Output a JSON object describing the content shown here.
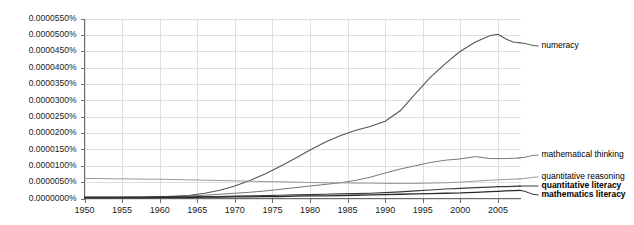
{
  "chart_data": {
    "type": "line",
    "title": "",
    "xlabel": "",
    "ylabel": "",
    "grid": true,
    "legend_position": "inline-right",
    "xlim": [
      1950,
      2008
    ],
    "ylim": [
      0.0,
      5.5e-06
    ],
    "x_tick_labels": [
      "1950",
      "1955",
      "1960",
      "1965",
      "1970",
      "1975",
      "1980",
      "1985",
      "1990",
      "1995",
      "2000",
      "2005"
    ],
    "x_ticks": [
      1950,
      1955,
      1960,
      1965,
      1970,
      1975,
      1980,
      1985,
      1990,
      1995,
      2000,
      2005
    ],
    "y_tick_labels": [
      "0.0000550%",
      "0.0000500%",
      "0.0000450%",
      "0.0000400%",
      "0.0000350%",
      "0.0000300%",
      "0.0000250%",
      "0.0000200%",
      "0.0000150%",
      "0.0000100%",
      "0.0000050%",
      "0.0000000%"
    ],
    "y_ticks": [
      5.5e-06,
      5e-06,
      4.5e-06,
      4e-06,
      3.5e-06,
      3e-06,
      2.5e-06,
      2e-06,
      1.5e-06,
      1e-06,
      5e-07,
      0.0
    ],
    "x": [
      1950,
      1952,
      1954,
      1956,
      1958,
      1960,
      1962,
      1964,
      1966,
      1968,
      1970,
      1972,
      1974,
      1976,
      1978,
      1980,
      1982,
      1984,
      1986,
      1988,
      1990,
      1992,
      1994,
      1996,
      1998,
      2000,
      2002,
      2004,
      2005,
      2006,
      2007,
      2008
    ],
    "series": [
      {
        "name": "numeracy",
        "color": "#555555",
        "width": 1.1,
        "label_color": "#555555",
        "values": [
          2e-08,
          2e-08,
          3e-08,
          3e-08,
          4e-08,
          5e-08,
          7e-08,
          1e-07,
          1.6e-07,
          2.5e-07,
          3.8e-07,
          5.5e-07,
          7.5e-07,
          9.8e-07,
          1.22e-06,
          1.48e-06,
          1.72e-06,
          1.92e-06,
          2.08e-06,
          2.2e-06,
          2.36e-06,
          2.68e-06,
          3.2e-06,
          3.7e-06,
          4.12e-06,
          4.5e-06,
          4.78e-06,
          4.98e-06,
          5.02e-06,
          4.88e-06,
          4.78e-06,
          4.76e-06
        ]
      },
      {
        "name": "mathematical thinking",
        "color": "#777777",
        "width": 1.0,
        "label_color": "#777777",
        "values": [
          4e-08,
          4e-08,
          4e-08,
          5e-08,
          5e-08,
          6e-08,
          7e-08,
          8e-08,
          1e-07,
          1.3e-07,
          1.6e-07,
          1.9e-07,
          2.3e-07,
          2.8e-07,
          3.3e-07,
          3.8e-07,
          4.3e-07,
          4.8e-07,
          5.5e-07,
          6.5e-07,
          7.8e-07,
          9e-07,
          1e-06,
          1.1e-06,
          1.17e-06,
          1.21e-06,
          1.28e-06,
          1.22e-06,
          1.22e-06,
          1.22e-06,
          1.23e-06,
          1.24e-06
        ]
      },
      {
        "name": "quantitative reasoning",
        "color": "#999999",
        "width": 1.0,
        "label_color": "#8a8a8a",
        "values": [
          6.1e-07,
          6.1e-07,
          6e-07,
          6e-07,
          5.9e-07,
          5.9e-07,
          5.8e-07,
          5.7e-07,
          5.6e-07,
          5.5e-07,
          5.4e-07,
          5.3e-07,
          5.2e-07,
          5.1e-07,
          5e-07,
          4.9e-07,
          4.8e-07,
          4.8e-07,
          4.7e-07,
          4.7e-07,
          4.6e-07,
          4.6e-07,
          4.6e-07,
          4.7e-07,
          4.8e-07,
          5e-07,
          5.3e-07,
          5.6e-07,
          5.7e-07,
          5.8e-07,
          5.9e-07,
          6e-07
        ]
      },
      {
        "name": "quantitative literacy",
        "color": "#3a3a3a",
        "width": 1.2,
        "label_color": "#111111",
        "values": [
          4e-08,
          4e-08,
          4e-08,
          4e-08,
          4e-08,
          5e-08,
          5e-08,
          5e-08,
          6e-08,
          6e-08,
          7e-08,
          8e-08,
          9e-08,
          1e-07,
          1.1e-07,
          1.2e-07,
          1.3e-07,
          1.4e-07,
          1.5e-07,
          1.6e-07,
          1.8e-07,
          2e-07,
          2.3e-07,
          2.6e-07,
          2.9e-07,
          3.1e-07,
          3.3e-07,
          3.5e-07,
          3.6e-07,
          3.6e-07,
          3.7e-07,
          3.8e-07
        ]
      },
      {
        "name": "mathematics literacy",
        "color": "#2a2a2a",
        "width": 1.3,
        "label_color": "#111111",
        "values": [
          2e-08,
          2e-08,
          2e-08,
          2e-08,
          2e-08,
          3e-08,
          3e-08,
          3e-08,
          4e-08,
          4e-08,
          5e-08,
          5e-08,
          6e-08,
          6e-08,
          7e-08,
          8e-08,
          8e-08,
          9e-08,
          1e-07,
          1.1e-07,
          1.2e-07,
          1.3e-07,
          1.4e-07,
          1.5e-07,
          1.6e-07,
          1.7e-07,
          1.9e-07,
          2.1e-07,
          2.2e-07,
          2.3e-07,
          2.4e-07,
          2.5e-07
        ]
      }
    ],
    "series_labels": [
      {
        "text": "numeracy",
        "anchor_y": 4.76e-06,
        "label_y_px": 46
      },
      {
        "text": "mathematical thinking",
        "anchor_y": 1.24e-06,
        "label_y_px": 155
      },
      {
        "text": "quantitative reasoning",
        "anchor_y": 6e-07,
        "label_y_px": 177
      },
      {
        "text": "quantitative literacy",
        "anchor_y": 3.8e-07,
        "label_y_px": 186
      },
      {
        "text": "mathematics literacy",
        "anchor_y": 2.5e-07,
        "label_y_px": 195
      }
    ]
  }
}
